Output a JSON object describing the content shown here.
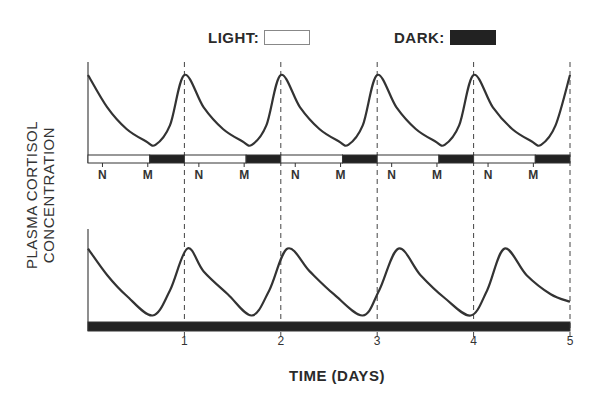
{
  "legend": {
    "light_label": "LIGHT:",
    "dark_label": "DARK:",
    "light_color": "#ffffff",
    "dark_color": "#222222"
  },
  "axes": {
    "ylabel_line1": "PLASMA CORTISOL",
    "ylabel_line2": "CONCENTRATION",
    "xlabel": "TIME (DAYS)"
  },
  "chart_data": [
    {
      "type": "line",
      "title": "Light/dark cycle (entrained)",
      "xlabel": "TIME (DAYS)",
      "ylabel": "PLASMA CORTISOL CONCENTRATION",
      "xlim": [
        0,
        5
      ],
      "ylim": [
        0,
        1
      ],
      "grid": "dashed vertical lines at each day",
      "description": "Cortisol rises sharply at end of dark period, peaks at each day boundary (~every 24 h), then declines through the light period to a trough near the start of the next dark phase.",
      "x": [
        0,
        0.2,
        0.4,
        0.6,
        0.7,
        0.85,
        1.0,
        1.2,
        1.4,
        1.6,
        1.7,
        1.85,
        2.0,
        2.2,
        2.4,
        2.6,
        2.7,
        2.85,
        3.0,
        3.2,
        3.4,
        3.6,
        3.7,
        3.85,
        4.0,
        4.2,
        4.4,
        4.6,
        4.7,
        4.85,
        5.0
      ],
      "values": [
        1.0,
        0.55,
        0.25,
        0.08,
        0.03,
        0.3,
        1.0,
        0.55,
        0.25,
        0.08,
        0.03,
        0.3,
        1.0,
        0.55,
        0.25,
        0.08,
        0.03,
        0.3,
        1.0,
        0.55,
        0.25,
        0.08,
        0.03,
        0.3,
        1.0,
        0.55,
        0.25,
        0.08,
        0.03,
        0.3,
        1.0
      ],
      "photoperiod_bar": [
        {
          "phase": "light",
          "start": 0.0,
          "end": 0.64
        },
        {
          "phase": "dark",
          "start": 0.64,
          "end": 1.0
        },
        {
          "phase": "light",
          "start": 1.0,
          "end": 1.64
        },
        {
          "phase": "dark",
          "start": 1.64,
          "end": 2.0
        },
        {
          "phase": "light",
          "start": 2.0,
          "end": 2.64
        },
        {
          "phase": "dark",
          "start": 2.64,
          "end": 3.0
        },
        {
          "phase": "light",
          "start": 3.0,
          "end": 3.64
        },
        {
          "phase": "dark",
          "start": 3.64,
          "end": 4.0
        },
        {
          "phase": "light",
          "start": 4.0,
          "end": 4.64
        },
        {
          "phase": "dark",
          "start": 4.64,
          "end": 5.0
        }
      ],
      "bar_tick_labels": [
        {
          "x": 0.15,
          "label": "N"
        },
        {
          "x": 0.62,
          "label": "M"
        },
        {
          "x": 1.15,
          "label": "N"
        },
        {
          "x": 1.62,
          "label": "M"
        },
        {
          "x": 2.15,
          "label": "N"
        },
        {
          "x": 2.62,
          "label": "M"
        },
        {
          "x": 3.15,
          "label": "N"
        },
        {
          "x": 3.62,
          "label": "M"
        },
        {
          "x": 4.15,
          "label": "N"
        },
        {
          "x": 4.62,
          "label": "M"
        }
      ]
    },
    {
      "type": "line",
      "title": "Constant darkness (free-running)",
      "xlabel": "TIME (DAYS)",
      "ylabel": "PLASMA CORTISOL CONCENTRATION",
      "xlim": [
        0,
        5
      ],
      "ylim": [
        0,
        1
      ],
      "x_tick_labels": [
        "1",
        "2",
        "3",
        "4",
        "5"
      ],
      "x_ticks": [
        1,
        2,
        3,
        4,
        5
      ],
      "description": "In constant darkness the rhythm free-runs with a period slightly longer than 24 h; peaks drift progressively later relative to day boundaries.",
      "peaks_x": [
        0.0,
        1.03,
        2.07,
        3.22,
        4.32
      ],
      "troughs_x": [
        0.67,
        1.7,
        2.85,
        3.97
      ],
      "x": [
        0,
        0.2,
        0.4,
        0.67,
        0.85,
        1.03,
        1.2,
        1.45,
        1.7,
        1.88,
        2.07,
        2.3,
        2.55,
        2.85,
        3.02,
        3.22,
        3.45,
        3.7,
        3.97,
        4.14,
        4.32,
        4.55,
        4.8,
        5.0
      ],
      "values": [
        0.9,
        0.55,
        0.28,
        0.02,
        0.35,
        0.9,
        0.6,
        0.3,
        0.02,
        0.35,
        0.9,
        0.6,
        0.3,
        0.02,
        0.35,
        0.9,
        0.55,
        0.25,
        0.02,
        0.35,
        0.9,
        0.55,
        0.3,
        0.2
      ],
      "photoperiod_bar": [
        {
          "phase": "dark",
          "start": 0.0,
          "end": 5.0
        }
      ]
    }
  ]
}
